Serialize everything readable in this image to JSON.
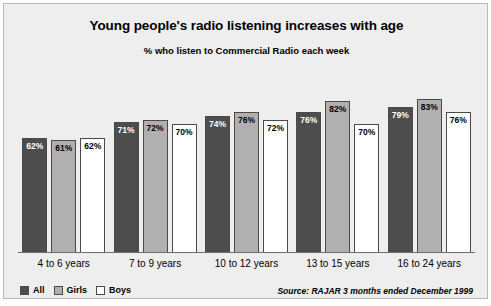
{
  "chart_data": {
    "type": "bar",
    "title": "Young people's radio listening increases with age",
    "subtitle": "% who listen to Commercial Radio each week",
    "xlabel": "",
    "ylabel": "",
    "ylim": [
      0,
      100
    ],
    "grid": false,
    "legend_position": "bottom-left",
    "categories": [
      "4 to 6 years",
      "7 to 9 years",
      "10 to 12 years",
      "13 to 15 years",
      "16 to 24 years"
    ],
    "series": [
      {
        "name": "All",
        "color": "#4d4d4d",
        "values": [
          62,
          71,
          74,
          76,
          79
        ],
        "labels": [
          "62%",
          "71%",
          "74%",
          "76%",
          "79%"
        ]
      },
      {
        "name": "Girls",
        "color": "#b0b0b0",
        "values": [
          61,
          72,
          76,
          82,
          83
        ],
        "labels": [
          "61%",
          "72%",
          "76%",
          "82%",
          "83%"
        ]
      },
      {
        "name": "Boys",
        "color": "#ffffff",
        "values": [
          62,
          70,
          72,
          70,
          76
        ],
        "labels": [
          "62%",
          "70%",
          "72%",
          "70%",
          "76%"
        ]
      }
    ],
    "source": "Source: RAJAR 3 months ended December 1999"
  }
}
